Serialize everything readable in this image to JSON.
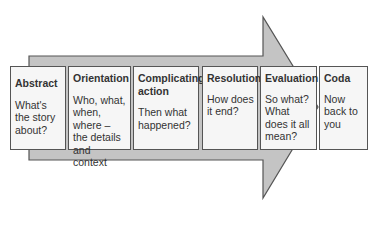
{
  "diagram": {
    "type": "arrow-sequence",
    "colors": {
      "arrow_fill": "#c4c4c4",
      "arrow_stroke": "#555555",
      "box_fill": "#f6f6f6",
      "text": "#333333"
    },
    "stages": [
      {
        "title": "Abstract",
        "text": "What's the story about?"
      },
      {
        "title": "Orientation",
        "text": "Who, what, when, where – the details and context"
      },
      {
        "title": "Complicating action",
        "text": "Then what happened?"
      },
      {
        "title": "Resolution",
        "text": "How does it end?"
      },
      {
        "title": "Evaluation",
        "text": "So what? What does it all mean?"
      },
      {
        "title": "Coda",
        "text": "Now back to you"
      }
    ]
  }
}
